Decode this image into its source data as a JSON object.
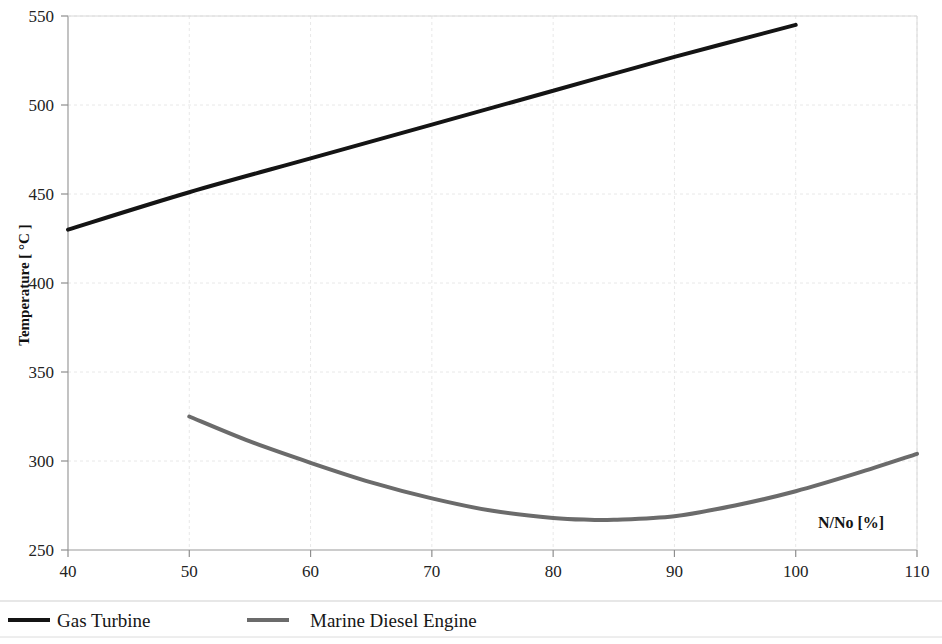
{
  "chart_data": {
    "type": "line",
    "title": "",
    "subtitle": "",
    "xlabel": "N/No  [%]",
    "ylabel": "Temperature [ °C ]",
    "xlim": [
      40,
      110
    ],
    "ylim": [
      250,
      550
    ],
    "xticks": [
      40,
      50,
      60,
      70,
      80,
      90,
      100,
      110
    ],
    "yticks": [
      250,
      300,
      350,
      400,
      450,
      500,
      550
    ],
    "xtick_labels": [
      "40",
      "50",
      "60",
      "70",
      "80",
      "90",
      "100",
      "110"
    ],
    "ytick_labels": [
      "250",
      "300",
      "350",
      "400",
      "450",
      "500",
      "550"
    ],
    "grid": true,
    "grid_color": "#e8e8e8",
    "legend_position": "bottom",
    "annotations": [
      {
        "text": "N/No  [%]",
        "x": 100,
        "y": 266
      }
    ],
    "series": [
      {
        "name": "Gas Turbine",
        "color": "#141414",
        "width": 4,
        "x": [
          40,
          50,
          60,
          70,
          80,
          90,
          100
        ],
        "values": [
          430,
          451,
          470,
          489,
          508,
          527,
          545
        ]
      },
      {
        "name": "Marine Diesel Engine",
        "color": "#6b6b6b",
        "width": 4,
        "x": [
          50,
          55,
          60,
          65,
          70,
          75,
          80,
          83,
          85,
          90,
          95,
          100,
          105,
          110
        ],
        "values": [
          325,
          311,
          299,
          288,
          279,
          272,
          268,
          267,
          267,
          269,
          275,
          283,
          293,
          304
        ]
      }
    ]
  },
  "axis": {
    "y_title": "Temperature [ °C ]",
    "x_annotation": "N/No  [%]"
  },
  "legend": {
    "items": [
      {
        "label": "Gas Turbine",
        "color": "#141414"
      },
      {
        "label": "Marine Diesel Engine",
        "color": "#6b6b6b"
      }
    ]
  }
}
